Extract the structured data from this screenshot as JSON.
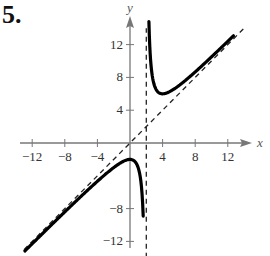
{
  "problem_number": "5.",
  "chart_data": {
    "type": "line",
    "title": "",
    "xlabel": "x",
    "ylabel": "y",
    "xlim": [
      -15,
      17
    ],
    "ylim": [
      -14,
      14
    ],
    "grid": false,
    "x_ticks": [
      -12,
      -8,
      -4,
      4,
      8,
      12
    ],
    "y_ticks": [
      12,
      8,
      4,
      -8,
      -12
    ],
    "x_tick_labels": [
      "−12",
      "−8",
      "−4",
      "4",
      "8",
      "12"
    ],
    "y_tick_labels": [
      "12",
      "8",
      "4",
      "−8",
      "−12"
    ],
    "function": "y = x + 4/(x - 2)",
    "series": [
      {
        "name": "left branch",
        "style": "solid",
        "x": [
          -13,
          -10,
          -8,
          -6,
          -4,
          -2,
          -1,
          0,
          0.5,
          1,
          1.5,
          1.7
        ],
        "y": [
          -13.27,
          -10.33,
          -8.4,
          -6.5,
          -4.67,
          -3,
          -2.33,
          -2,
          -2.17,
          -3,
          -6.5,
          -11.63
        ]
      },
      {
        "name": "right branch",
        "style": "solid",
        "x": [
          2.3,
          2.5,
          3,
          3.5,
          4,
          5,
          6,
          8,
          10,
          12,
          14
        ],
        "y": [
          15.63,
          10.5,
          7,
          6.17,
          6,
          6.33,
          7,
          8.67,
          10.5,
          12.4,
          14.33
        ]
      },
      {
        "name": "vertical asymptote",
        "style": "dashed",
        "x": [
          2,
          2
        ],
        "y": [
          -14,
          14
        ]
      },
      {
        "name": "slant asymptote",
        "style": "dashed",
        "x": [
          -13,
          14
        ],
        "y": [
          -13,
          14
        ]
      }
    ],
    "annotations": []
  }
}
